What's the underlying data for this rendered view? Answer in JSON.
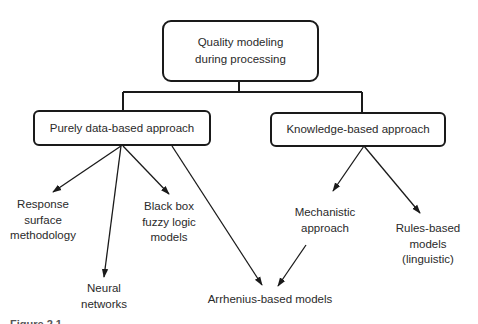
{
  "root": {
    "line1": "Quality modeling",
    "line2": "during processing"
  },
  "branches": {
    "data_based": "Purely data-based approach",
    "knowledge_based": "Knowledge-based approach"
  },
  "leaves": {
    "response_surface": {
      "line1": "Response",
      "line2": "surface",
      "line3": "methodology"
    },
    "neural_networks": {
      "line1": "Neural",
      "line2": "networks"
    },
    "black_box": {
      "line1": "Black box",
      "line2": "fuzzy logic",
      "line3": "models"
    },
    "arrhenius": "Arrhenius-based models",
    "mechanistic": {
      "line1": "Mechanistic",
      "line2": "approach"
    },
    "rules_based": {
      "line1": "Rules-based",
      "line2": "models",
      "line3": "(linguistic)"
    }
  },
  "caption": "Figure 2.1"
}
